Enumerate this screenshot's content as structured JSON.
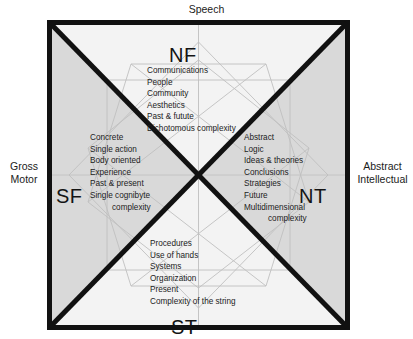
{
  "diagram": {
    "colors": {
      "frame": "#111111",
      "fill_light": "#f0f0f0",
      "fill_gray": "#d7d7d7",
      "pattern_line": "#b9b9b9",
      "text": "#1b1b1b"
    },
    "axes": {
      "top": "Speech",
      "left": "Gross\nMotor",
      "right": "Abstract\nIntellectual"
    },
    "quadrants": {
      "nf": {
        "label": "NF",
        "items": [
          "Communications",
          "People",
          "Community",
          "Aesthetics",
          "Past & futute",
          "Dichotomous complexity"
        ]
      },
      "sf": {
        "label": "SF",
        "items": [
          "Concrete",
          "Single action",
          "Body oriented",
          "Experience",
          "Past & present",
          "Single cognibyte",
          "complexity"
        ]
      },
      "nt": {
        "label": "NT",
        "items": [
          "Abstract",
          "Logic",
          "Ideas & theories",
          "Conclusions",
          "Strategies",
          "Future",
          "Multidimensional",
          "complexity"
        ]
      },
      "st": {
        "label": "ST",
        "items": [
          "Procedures",
          "Use of hands",
          "Systems",
          "Organization",
          "Present",
          "Complexity of the string"
        ]
      }
    }
  }
}
